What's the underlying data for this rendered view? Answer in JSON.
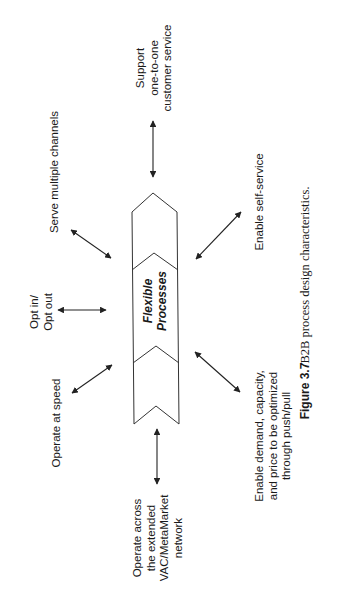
{
  "figure": {
    "center_label": "Flexible\nProcesses",
    "nodes": [
      {
        "id": "support",
        "label": "Support\none-to-one\ncustomer service"
      },
      {
        "id": "channels",
        "label": "Serve multiple channels"
      },
      {
        "id": "opt",
        "label": "Opt in/\nOpt out"
      },
      {
        "id": "speed",
        "label": "Operate at speed"
      },
      {
        "id": "network",
        "label": "Operate across\nthe extended\nVAC/MetaMarket\nnetwork"
      },
      {
        "id": "self_service",
        "label": "Enable self-service"
      },
      {
        "id": "demand",
        "label": "Enable demand, capacity,\nand price to be optimized\nthrough push/pull"
      }
    ],
    "caption": {
      "number": "Figure 3.7",
      "text": "B2B process design characteristics."
    },
    "colors": {
      "stroke": "#222222",
      "text": "#1a1a1a",
      "background": "#ffffff"
    }
  }
}
